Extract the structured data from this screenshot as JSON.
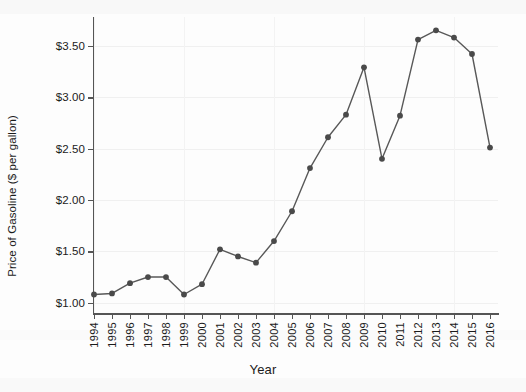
{
  "chart_data": {
    "type": "line",
    "title": "",
    "xlabel": "Year",
    "ylabel": "Price of Gasoline ($ per gallon)",
    "categories": [
      1994,
      1995,
      1996,
      1997,
      1998,
      1999,
      2000,
      2001,
      2002,
      2003,
      2004,
      2005,
      2006,
      2007,
      2008,
      2009,
      2010,
      2011,
      2012,
      2013,
      2014,
      2015,
      2016
    ],
    "values": [
      1.08,
      1.09,
      1.19,
      1.25,
      1.25,
      1.08,
      1.18,
      1.52,
      1.45,
      1.39,
      1.6,
      1.89,
      2.31,
      2.61,
      2.83,
      3.29,
      2.4,
      2.82,
      3.56,
      3.65,
      3.58,
      3.42,
      2.51
    ],
    "series": [
      {
        "name": "Price of Gasoline",
        "values": [
          1.08,
          1.09,
          1.19,
          1.25,
          1.25,
          1.08,
          1.18,
          1.52,
          1.45,
          1.39,
          1.6,
          1.89,
          2.31,
          2.61,
          2.83,
          3.29,
          2.4,
          2.82,
          3.56,
          3.65,
          3.58,
          3.42,
          2.51
        ]
      }
    ],
    "ylim": [
      0.9,
      3.78
    ],
    "xlim": [
      1993.5,
      2016.5
    ],
    "ytick_labels": [
      "$1.00",
      "$1.50",
      "$2.00",
      "$2.50",
      "$3.00",
      "$3.50"
    ],
    "ytick_values": [
      1.0,
      1.5,
      2.0,
      2.5,
      3.0,
      3.5
    ],
    "xtick_labels": [
      "1994",
      "1995",
      "1996",
      "1997",
      "1998",
      "1999",
      "2000",
      "2001",
      "2002",
      "2003",
      "2004",
      "2005",
      "2006",
      "2007",
      "2008",
      "2009",
      "2010",
      "2011",
      "2012",
      "2013",
      "2014",
      "2015",
      "2016"
    ],
    "grid": true,
    "legend": null,
    "legend_position": "none",
    "line_color": "#585858",
    "marker_color": "#4a4a4a",
    "marker": "circle",
    "axis_color": "#555555",
    "background_color": "#fdfdfd"
  },
  "axis": {
    "y_title": "Price of Gasoline ($ per gallon)",
    "x_title": "Year"
  }
}
